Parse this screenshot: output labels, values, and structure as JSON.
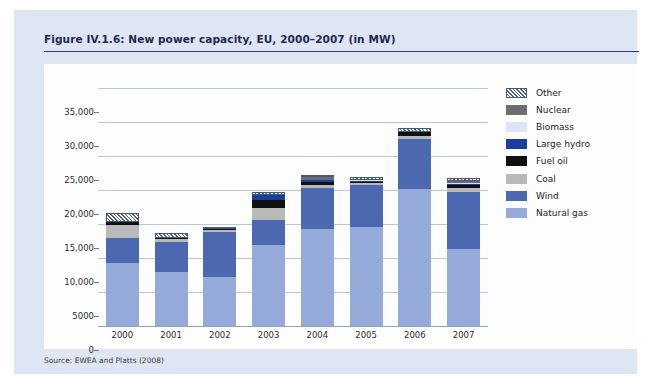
{
  "figure": {
    "title": "Figure IV.1.6: New power capacity, EU, 2000–2007 (in MW)",
    "source": "Source: EWEA and Platts (2008)"
  },
  "colors": {
    "panel_background": "#dfe5f2",
    "canvas_background": "#fdfdfe",
    "title_text": "#1b2a52",
    "title_rule": "#2c3f73",
    "gridline": "#b9c6e0",
    "natural_gas": "#96aada",
    "wind": "#4c68b0",
    "coal": "#b9b9b9",
    "fuel_oil": "#101010",
    "large_hydro": "#1b3f9c",
    "biomass": "#dde4f5",
    "nuclear": "#6d6d6d",
    "other": "#ffffff"
  },
  "legend": {
    "position": "right",
    "items": [
      {
        "label": "Other",
        "color": "#ffffff",
        "pattern": "hatch"
      },
      {
        "label": "Nuclear",
        "color": "#6d6d6d",
        "pattern": "solid"
      },
      {
        "label": "Biomass",
        "color": "#dde4f5",
        "pattern": "solid"
      },
      {
        "label": "Large hydro",
        "color": "#1b3f9c",
        "pattern": "solid"
      },
      {
        "label": "Fuel oil",
        "color": "#101010",
        "pattern": "solid"
      },
      {
        "label": "Coal",
        "color": "#b9b9b9",
        "pattern": "solid"
      },
      {
        "label": "Wind",
        "color": "#4c68b0",
        "pattern": "solid"
      },
      {
        "label": "Natural gas",
        "color": "#96aada",
        "pattern": "solid"
      }
    ]
  },
  "axes": {
    "y_ticks": [
      0,
      5000,
      10000,
      15000,
      20000,
      25000,
      30000,
      35000
    ],
    "y_tick_labels": [
      "0",
      "5000",
      "10,000",
      "15,000",
      "20,000",
      "25,000",
      "30,000",
      "35,000"
    ],
    "y_min": 0,
    "y_max": 35000,
    "x_categories": [
      "2000",
      "2001",
      "2002",
      "2003",
      "2004",
      "2005",
      "2006",
      "2007"
    ]
  },
  "chart_data": {
    "type": "bar",
    "stacked": true,
    "title": "Figure IV.1.6: New power capacity, EU, 2000–2007 (in MW)",
    "xlabel": "",
    "ylabel": "",
    "ylim": [
      0,
      35000
    ],
    "grid": true,
    "legend_position": "right",
    "categories": [
      "2000",
      "2001",
      "2002",
      "2003",
      "2004",
      "2005",
      "2006",
      "2007"
    ],
    "series": [
      {
        "name": "Natural gas",
        "color": "#96aada",
        "values": [
          9200,
          7900,
          7200,
          11900,
          14200,
          14500,
          20100,
          11300
        ]
      },
      {
        "name": "Wind",
        "color": "#4c68b0",
        "values": [
          3700,
          4500,
          6600,
          3700,
          6100,
          6300,
          7400,
          8400
        ]
      },
      {
        "name": "Coal",
        "color": "#b9b9b9",
        "values": [
          1900,
          350,
          250,
          1700,
          450,
          200,
          450,
          600
        ]
      },
      {
        "name": "Fuel oil",
        "color": "#101010",
        "values": [
          500,
          150,
          150,
          1300,
          400,
          150,
          550,
          450
        ]
      },
      {
        "name": "Large hydro",
        "color": "#1b3f9c",
        "values": [
          0,
          0,
          0,
          700,
          350,
          150,
          100,
          100
        ]
      },
      {
        "name": "Biomass",
        "color": "#dde4f5",
        "values": [
          0,
          0,
          0,
          0,
          0,
          150,
          0,
          150
        ]
      },
      {
        "name": "Nuclear",
        "color": "#6d6d6d",
        "values": [
          0,
          0,
          0,
          0,
          400,
          0,
          0,
          300
        ]
      },
      {
        "name": "Other",
        "color": "#ffffff",
        "values": [
          1300,
          800,
          400,
          350,
          350,
          450,
          450,
          400
        ]
      }
    ],
    "totals": [
      16600,
      13700,
      14600,
      19650,
      22250,
      21900,
      29550,
      21700
    ],
    "units": "MW",
    "source": "EWEA and Platts (2008)"
  }
}
